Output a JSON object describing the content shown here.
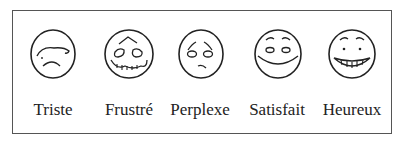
{
  "faces": [
    {
      "label": "Triste",
      "icon": "sad-face-icon"
    },
    {
      "label": "Frustré",
      "icon": "frustrated-face-icon"
    },
    {
      "label": "Perplexe",
      "icon": "perplexed-face-icon"
    },
    {
      "label": "Satisfait",
      "icon": "satisfied-face-icon"
    },
    {
      "label": "Heureux",
      "icon": "happy-face-icon"
    }
  ],
  "colors": {
    "stroke": "#222222",
    "border": "#555555",
    "background": "#ffffff"
  }
}
